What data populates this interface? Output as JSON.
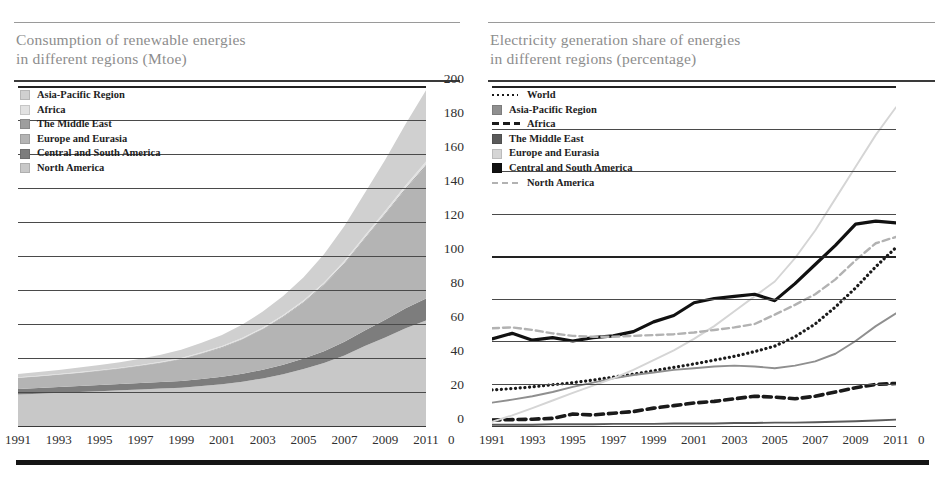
{
  "figure": {
    "bottom_rule": "decorative-bar"
  },
  "left_panel": {
    "title_line1": "Consumption of renewable energies",
    "title_line2": "in different regions (Mtoe)",
    "legend": [
      {
        "label": "Asia-Pacific Region",
        "color": "#d0d0d0",
        "key": "box"
      },
      {
        "label": "Africa",
        "color": "#e2e2e2",
        "key": "box"
      },
      {
        "label": "The Middle East",
        "color": "#9e9e9e",
        "key": "box"
      },
      {
        "label": "Europe and Eurasia",
        "color": "#b4b4b4",
        "key": "box"
      },
      {
        "label": "Central and South America",
        "color": "#7d7d7d",
        "key": "box"
      },
      {
        "label": "North America",
        "color": "#c8c8c8",
        "key": "box"
      }
    ],
    "yticks": [
      "200",
      "180",
      "160",
      "140",
      "120",
      "100",
      "80",
      "60",
      "40",
      "20",
      "0"
    ],
    "xticks": [
      "1991",
      "1993",
      "1995",
      "1997",
      "1999",
      "2001",
      "2003",
      "2005",
      "2007",
      "2009",
      "2011"
    ]
  },
  "right_panel": {
    "title_line1": "Electricity generation share of energies",
    "title_line2": "in different regions (percentage)",
    "legend": [
      {
        "label": "World",
        "color": "#1a1a1a",
        "key": "dotted"
      },
      {
        "label": "Asia-Pacific Region",
        "color": "#8f8f8f",
        "key": "box"
      },
      {
        "label": "Africa",
        "color": "#1a1a1a",
        "key": "dashthick"
      },
      {
        "label": "The Middle East",
        "color": "#5a5a5a",
        "key": "box"
      },
      {
        "label": "Europe and Eurasia",
        "color": "#d5d5d5",
        "key": "box"
      },
      {
        "label": "Central and South America",
        "color": "#111111",
        "key": "box"
      },
      {
        "label": "North America",
        "color": "#b2b2b2",
        "key": "dashlight"
      }
    ],
    "yticks": [
      "8",
      "7",
      "6",
      "5",
      "4",
      "3",
      "2",
      "1",
      "0"
    ],
    "xticks": [
      "1991",
      "1993",
      "1995",
      "1997",
      "1999",
      "2001",
      "2003",
      "2005",
      "2007",
      "2009",
      "2011"
    ]
  },
  "chart_data": [
    {
      "type": "area",
      "title": "Consumption of renewable energies in different regions (Mtoe)",
      "xlabel": "",
      "ylabel": "Mtoe",
      "stacked": true,
      "grid": true,
      "legend_position": "top-left",
      "xlim": [
        1991,
        2011
      ],
      "ylim": [
        0,
        200
      ],
      "x": [
        1991,
        1992,
        1993,
        1994,
        1995,
        1996,
        1997,
        1998,
        1999,
        2000,
        2001,
        2002,
        2003,
        2004,
        2005,
        2006,
        2007,
        2008,
        2009,
        2010,
        2011
      ],
      "series": [
        {
          "name": "North America",
          "color": "#c8c8c8",
          "values": [
            18.5,
            19.0,
            19.5,
            20.0,
            20.5,
            21.0,
            21.5,
            22.0,
            22.5,
            23.5,
            24.5,
            26.0,
            28.0,
            30.5,
            33.5,
            37.0,
            41.5,
            47.0,
            52.0,
            57.5,
            62.0
          ]
        },
        {
          "name": "Central and South America",
          "color": "#7d7d7d",
          "values": [
            3.2,
            3.3,
            3.4,
            3.5,
            3.6,
            3.7,
            3.8,
            3.9,
            4.0,
            4.2,
            4.4,
            4.7,
            5.1,
            5.6,
            6.2,
            7.0,
            8.0,
            9.2,
            10.5,
            11.8,
            13.0
          ]
        },
        {
          "name": "Europe and Eurasia",
          "color": "#b4b4b4",
          "values": [
            6.5,
            6.8,
            7.2,
            7.7,
            8.3,
            9.0,
            10.0,
            11.2,
            12.8,
            14.8,
            17.2,
            20.2,
            23.8,
            28.0,
            33.0,
            39.0,
            46.0,
            54.0,
            62.0,
            70.0,
            78.0
          ]
        },
        {
          "name": "The Middle East",
          "color": "#9e9e9e",
          "values": [
            0.15,
            0.16,
            0.17,
            0.18,
            0.19,
            0.2,
            0.22,
            0.24,
            0.26,
            0.28,
            0.3,
            0.33,
            0.36,
            0.4,
            0.44,
            0.48,
            0.53,
            0.58,
            0.63,
            0.68,
            0.75
          ]
        },
        {
          "name": "Africa",
          "color": "#e2e2e2",
          "values": [
            0.3,
            0.32,
            0.34,
            0.36,
            0.38,
            0.4,
            0.43,
            0.46,
            0.5,
            0.55,
            0.6,
            0.66,
            0.72,
            0.8,
            0.9,
            1.0,
            1.15,
            1.3,
            1.45,
            1.6,
            1.8
          ]
        },
        {
          "name": "Asia-Pacific Region",
          "color": "#d0d0d0",
          "values": [
            2.0,
            2.2,
            2.4,
            2.6,
            2.9,
            3.2,
            3.6,
            4.1,
            4.8,
            5.6,
            6.6,
            7.8,
            9.3,
            11.2,
            13.5,
            16.5,
            20.5,
            25.0,
            30.0,
            36.0,
            42.0
          ]
        }
      ]
    },
    {
      "type": "line",
      "title": "Electricity generation share of energies in different regions (percentage)",
      "xlabel": "",
      "ylabel": "percentage",
      "grid": true,
      "legend_position": "top-left",
      "xlim": [
        1991,
        2011
      ],
      "ylim": [
        0,
        8
      ],
      "x": [
        1991,
        1992,
        1993,
        1994,
        1995,
        1996,
        1997,
        1998,
        1999,
        2000,
        2001,
        2002,
        2003,
        2004,
        2005,
        2006,
        2007,
        2008,
        2009,
        2010,
        2011
      ],
      "series": [
        {
          "name": "World",
          "color": "#1a1a1a",
          "style": "dotted",
          "values": [
            0.85,
            0.88,
            0.92,
            0.97,
            1.02,
            1.08,
            1.15,
            1.22,
            1.3,
            1.38,
            1.46,
            1.55,
            1.64,
            1.75,
            1.88,
            2.1,
            2.4,
            2.8,
            3.25,
            3.75,
            4.2
          ]
        },
        {
          "name": "Asia-Pacific Region",
          "color": "#8f8f8f",
          "style": "solid",
          "values": [
            0.55,
            0.62,
            0.7,
            0.8,
            0.92,
            1.02,
            1.12,
            1.2,
            1.26,
            1.32,
            1.36,
            1.4,
            1.42,
            1.4,
            1.36,
            1.42,
            1.52,
            1.7,
            2.0,
            2.35,
            2.65
          ]
        },
        {
          "name": "Africa",
          "color": "#1a1a1a",
          "style": "dashed",
          "values": [
            0.14,
            0.15,
            0.16,
            0.18,
            0.28,
            0.26,
            0.3,
            0.34,
            0.42,
            0.48,
            0.54,
            0.58,
            0.64,
            0.7,
            0.68,
            0.64,
            0.7,
            0.8,
            0.9,
            0.98,
            1.0
          ]
        },
        {
          "name": "The Middle East",
          "color": "#5a5a5a",
          "style": "solid",
          "values": [
            0.03,
            0.03,
            0.03,
            0.04,
            0.04,
            0.04,
            0.05,
            0.05,
            0.05,
            0.06,
            0.06,
            0.06,
            0.07,
            0.07,
            0.08,
            0.08,
            0.09,
            0.1,
            0.11,
            0.13,
            0.15
          ]
        },
        {
          "name": "Europe and Eurasia",
          "color": "#d5d5d5",
          "style": "solid",
          "values": [
            0.1,
            0.25,
            0.42,
            0.6,
            0.78,
            0.95,
            1.12,
            1.32,
            1.55,
            1.78,
            2.05,
            2.35,
            2.7,
            3.05,
            3.4,
            3.95,
            4.6,
            5.35,
            6.1,
            6.85,
            7.5
          ]
        },
        {
          "name": "Central and South America",
          "color": "#111111",
          "style": "solid",
          "values": [
            2.05,
            2.18,
            2.02,
            2.08,
            2.0,
            2.08,
            2.12,
            2.22,
            2.45,
            2.6,
            2.9,
            3.0,
            3.05,
            3.1,
            2.95,
            3.35,
            3.8,
            4.25,
            4.75,
            4.82,
            4.78
          ]
        },
        {
          "name": "North America",
          "color": "#b2b2b2",
          "style": "dashed",
          "values": [
            2.3,
            2.32,
            2.26,
            2.18,
            2.12,
            2.1,
            2.1,
            2.12,
            2.14,
            2.16,
            2.2,
            2.26,
            2.32,
            2.4,
            2.62,
            2.85,
            3.1,
            3.45,
            3.9,
            4.3,
            4.45
          ]
        }
      ]
    }
  ]
}
